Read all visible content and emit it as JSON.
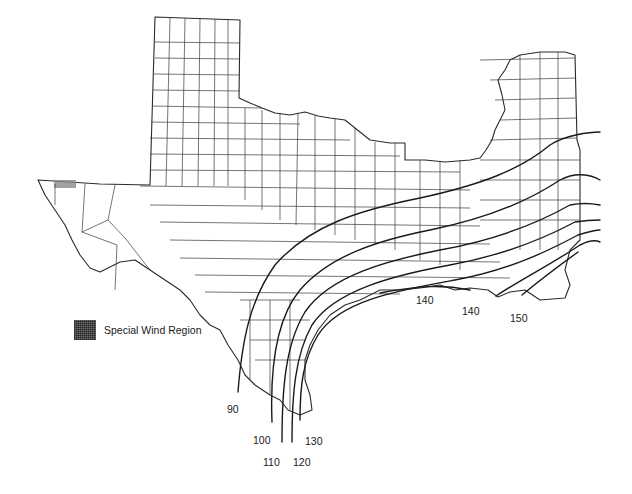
{
  "map": {
    "title": "",
    "region": "Texas, Louisiana, Mississippi wind speed contours",
    "legend": {
      "swatch_icon": "stipple-pattern-swatch",
      "label": "Special Wind Region"
    },
    "contour_labels": [
      {
        "id": "c90",
        "text": "90",
        "x": 227,
        "y": 404
      },
      {
        "id": "c100",
        "text": "100",
        "x": 253,
        "y": 435
      },
      {
        "id": "c110",
        "text": "110",
        "x": 263,
        "y": 457
      },
      {
        "id": "c120",
        "text": "120",
        "x": 293,
        "y": 457
      },
      {
        "id": "c130",
        "text": "130",
        "x": 305,
        "y": 436
      },
      {
        "id": "c140a",
        "text": "140",
        "x": 416,
        "y": 295
      },
      {
        "id": "c140b",
        "text": "140",
        "x": 462,
        "y": 306
      },
      {
        "id": "c150",
        "text": "150",
        "x": 510,
        "y": 313
      }
    ],
    "colors": {
      "background": "#ffffff",
      "lines": "#1a1a1a",
      "county_lines": "#3a3a3a",
      "special_region": "#8a8a8a"
    }
  }
}
